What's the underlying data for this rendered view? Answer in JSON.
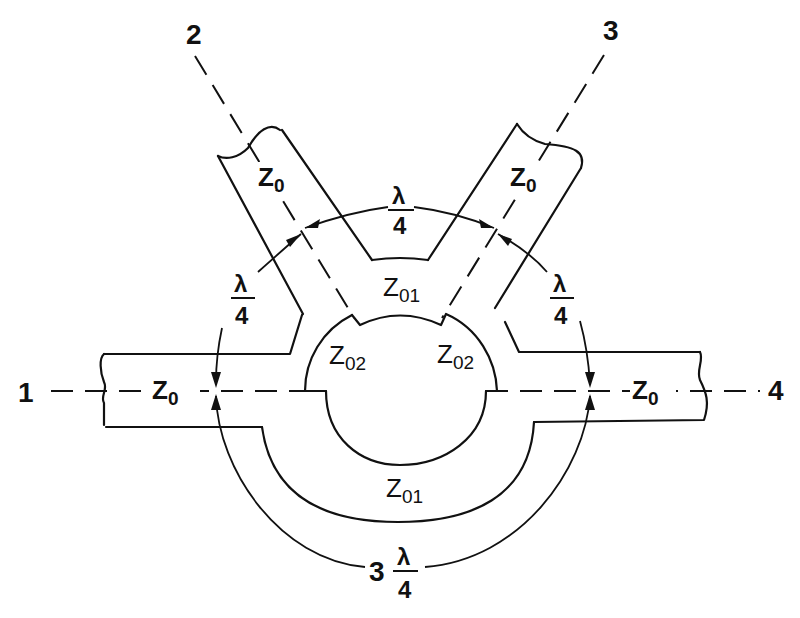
{
  "diagram": {
    "title": "",
    "ports": [
      {
        "id": "port-1",
        "label": "1"
      },
      {
        "id": "port-2",
        "label": "2"
      },
      {
        "id": "port-3",
        "label": "3"
      },
      {
        "id": "port-4",
        "label": "4"
      }
    ],
    "impedances": {
      "z0": {
        "main": "Z",
        "sub": "0"
      },
      "z01": {
        "main": "Z",
        "sub": "01"
      },
      "z02": {
        "main": "Z",
        "sub": "02"
      }
    },
    "spacings": {
      "quarter": {
        "numerator": "λ",
        "denominator": "4"
      },
      "three_quarter": {
        "coefficient": "3",
        "numerator": "λ",
        "denominator": "4"
      }
    },
    "colors": {
      "line": "#111111",
      "background": "#ffffff"
    }
  }
}
